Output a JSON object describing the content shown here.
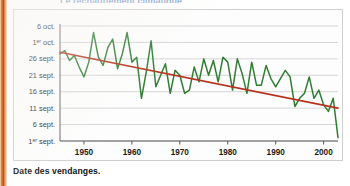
{
  "page": {
    "cropped_title": "Le réchauffement climatique",
    "edge_bar_color": "#c96426",
    "panel_bg": "#fdfdfd",
    "panel_border": "#cfcfcf"
  },
  "caption": {
    "text": "Date des vendanges."
  },
  "chart_data": {
    "type": "line",
    "title": "",
    "xlabel": "",
    "ylabel": "",
    "grid": "horizontal",
    "legend": "none",
    "xlim": [
      1945,
      2003
    ],
    "ylim": [
      0,
      35
    ],
    "y_unit": "days after 1 September",
    "xticks": [
      1950,
      1960,
      1970,
      1980,
      1990,
      2000
    ],
    "xtick_labels": [
      "1950",
      "1960",
      "1970",
      "1980",
      "1990",
      "2000"
    ],
    "yticks": [
      0,
      5,
      10,
      15,
      20,
      25,
      30,
      35
    ],
    "ytick_labels": [
      "1ᵉʳ sept.",
      "6 sept.",
      "11 sept.",
      "16 sept.",
      "21 sept.",
      "26 sept.",
      "1ᵉʳ oct.",
      "6 oct."
    ],
    "series": [
      {
        "name": "Date des vendanges",
        "type": "line",
        "color": "#2f7d32",
        "x": [
          1945,
          1946,
          1947,
          1948,
          1949,
          1950,
          1951,
          1952,
          1953,
          1954,
          1955,
          1956,
          1957,
          1958,
          1959,
          1960,
          1961,
          1962,
          1963,
          1964,
          1965,
          1966,
          1967,
          1968,
          1969,
          1970,
          1971,
          1972,
          1973,
          1974,
          1975,
          1976,
          1977,
          1978,
          1979,
          1980,
          1981,
          1982,
          1983,
          1984,
          1985,
          1986,
          1987,
          1988,
          1989,
          1990,
          1991,
          1992,
          1993,
          1994,
          1995,
          1996,
          1997,
          1998,
          1999,
          2000,
          2001,
          2002,
          2003
        ],
        "values": [
          26.5,
          27.5,
          24.5,
          26.0,
          22.5,
          19.5,
          24.0,
          33.0,
          25.5,
          23.0,
          28.5,
          31.0,
          22.0,
          26.5,
          33.0,
          24.0,
          25.5,
          13.0,
          21.0,
          30.5,
          16.5,
          20.0,
          23.5,
          14.5,
          21.5,
          20.0,
          14.5,
          15.5,
          22.5,
          18.0,
          25.0,
          20.0,
          24.5,
          18.0,
          25.5,
          24.0,
          15.5,
          25.0,
          20.5,
          14.5,
          24.0,
          17.0,
          17.0,
          23.0,
          19.0,
          16.5,
          19.0,
          21.5,
          19.5,
          10.5,
          13.0,
          14.5,
          19.5,
          13.0,
          15.5,
          11.0,
          9.0,
          13.0,
          1.0
        ]
      },
      {
        "name": "Tendance linéaire",
        "type": "trend",
        "color": "#b5321e",
        "x": [
          1945,
          2003
        ],
        "values": [
          27.0,
          10.0
        ]
      }
    ]
  }
}
